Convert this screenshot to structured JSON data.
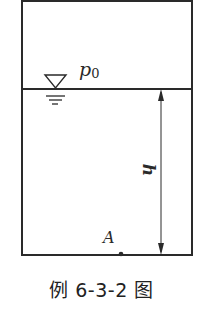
{
  "diagram": {
    "type": "fluid-tank",
    "labels": {
      "surface_pressure": "p",
      "surface_pressure_sub": "0",
      "depth": "h",
      "point": "A"
    },
    "colors": {
      "line": "#2a2a2a",
      "background": "#ffffff"
    }
  },
  "caption": "例 6-3-2 图"
}
